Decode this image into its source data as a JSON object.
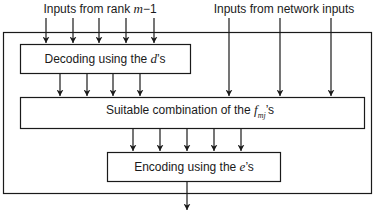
{
  "diagram": {
    "labels": {
      "rank_inputs": {
        "prefix": "Inputs from rank ",
        "var": "m",
        "suffix": "−1"
      },
      "network_inputs": "Inputs from network inputs"
    },
    "boxes": {
      "decoding": {
        "prefix": "Decoding using the ",
        "var": "d",
        "suffix": "’s"
      },
      "combination": {
        "prefix": "Suitable combination of the ",
        "var": "f",
        "sub": "mj",
        "suffix": "’s"
      },
      "encoding": {
        "prefix": "Encoding using the ",
        "var": "e",
        "suffix": "’s"
      }
    },
    "colors": {
      "stroke": "#1a1a1a",
      "background": "#ffffff"
    }
  }
}
